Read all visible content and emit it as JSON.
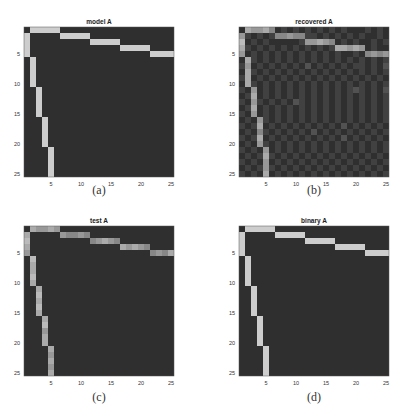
{
  "chart_data": [
    {
      "type": "heatmap",
      "title": "model A",
      "caption": "(a)",
      "rows": 25,
      "cols": 25,
      "x_ticks": [
        "5",
        "10",
        "15",
        "20",
        "25"
      ],
      "y_ticks": [
        "5",
        "10",
        "15",
        "20",
        "25"
      ],
      "colormap": "gray",
      "value_range": [
        0,
        1
      ],
      "scale_note": "cells given as digit strings 0-9 (intensity/9), one string per row",
      "matrix": [
        "0999990000000000000000000",
        "9000009999900000000000000",
        "9000000000099999000000000",
        "9000000000000000999990000",
        "9000000000000000000009999",
        "0900000000000000000000000",
        "0900000000000000000000000",
        "0900000000000000000000000",
        "0900000000000000000000000",
        "0900000000000000000000000",
        "0090000000000000000000000",
        "0090000000000000000000000",
        "0090000000000000000000000",
        "0090000000000000000000000",
        "0090000000000000000000000",
        "0009000000000000000000000",
        "0009000000000000000000000",
        "0009000000000000000000000",
        "0009000000000000000000000",
        "0009000000000000000000000",
        "0000900000000000000000000",
        "0000900000000000000000000",
        "0000900000000000000000000",
        "0000900000000000000000000",
        "0000900000000000000000000"
      ]
    },
    {
      "type": "heatmap",
      "title": "recovered A",
      "caption": "(b)",
      "rows": 25,
      "cols": 25,
      "x_ticks": [
        "5",
        "10",
        "15",
        "20",
        "25"
      ],
      "y_ticks": [
        "5",
        "10",
        "15",
        "20",
        "25"
      ],
      "colormap": "gray",
      "value_range": [
        0,
        1
      ],
      "scale_note": "cells given as digit strings 0-9 (intensity/9), one string per row",
      "matrix": [
        "0766750101010101010001010",
        "6101015565511010101010010",
        "8010100000166765010100101",
        "7101010101010101776760100",
        "6010101010101010100105656",
        "0710101010101010101010101",
        "1601010101020101010110102",
        "0710101010101010101010101",
        "1701010101010101010101010",
        "0710101010101010101010101",
        "1060101010101010101210102",
        "0170101010101010101010101",
        "1061010102101010101010101",
        "0170101010101010101010101",
        "1060101010101010101010101",
        "0106101010101010101010101",
        "1017010101010101020101010",
        "0105101010102010101010101",
        "1017010101010101020101010",
        "0106101010101010101010101",
        "1010601010101010101010101",
        "0101710101010101010101010",
        "1010601010101010101010101",
        "0101610101010101010101010",
        "1010701010101010101010101"
      ]
    },
    {
      "type": "heatmap",
      "title": "test A",
      "caption": "(c)",
      "rows": 25,
      "cols": 25,
      "x_ticks": [
        "5",
        "10",
        "15",
        "20",
        "25"
      ],
      "y_ticks": [
        "5",
        "10",
        "15",
        "20",
        "25"
      ],
      "colormap": "gray",
      "value_range": [
        0,
        1
      ],
      "scale_note": "cells given as digit strings 0-9 (intensity/9), one string per row",
      "matrix": [
        "0766760000000000000000000",
        "7000006556500000000000000",
        "8000000000056765000000000",
        "7000000000000000767650000",
        "6000000000000000000005657",
        "0800000000000000000000000",
        "0700000000000000000000000",
        "0700000000000000000000000",
        "0800000000000000000000000",
        "0700000000000000000000000",
        "0070000000000000000000000",
        "0080000000000000000000000",
        "0070000000000000000000000",
        "0080000000000000000000000",
        "0070000000000000000000000",
        "0007000000000000000000000",
        "0008000000000000000000000",
        "0006000000000000000000000",
        "0007000000000000000000000",
        "0007000000000000000000000",
        "0000700000000000000000000",
        "0000600000000000000000000",
        "0000700000000000000000000",
        "0000600000000000000000000",
        "0000700000000000000000000"
      ]
    },
    {
      "type": "heatmap",
      "title": "binary A",
      "caption": "(d)",
      "rows": 25,
      "cols": 25,
      "x_ticks": [
        "5",
        "10",
        "15",
        "20",
        "25"
      ],
      "y_ticks": [
        "5",
        "10",
        "15",
        "20",
        "25"
      ],
      "colormap": "gray",
      "value_range": [
        0,
        1
      ],
      "scale_note": "cells given as digit strings 0-9 (intensity/9), one string per row",
      "matrix": [
        "0999990000000000000000000",
        "9000009999900000000000000",
        "9000000000099999000000000",
        "9000000000000000999990000",
        "9000000000000000000009999",
        "0900000000000000000000000",
        "0900000000000000000000000",
        "0900000000000000000000000",
        "0900000000000000000000000",
        "0900000000000000000000000",
        "0090000000000000000000000",
        "0090000000000000000000000",
        "0090000000000000000000000",
        "0090000000000000000000000",
        "0090000000000000000000000",
        "0009000000000000000000000",
        "0009000000000000000000000",
        "0009000000000000000000000",
        "0009000000000000000000000",
        "0009000000000000000000000",
        "0000900000000000000000000",
        "0000900000000000000000000",
        "0000900000000000000000000",
        "0000900000000000000000000",
        "0000900000000000000000000"
      ]
    }
  ],
  "colors": {
    "low": "#2f2f2f",
    "high": "#cdcdcd"
  }
}
